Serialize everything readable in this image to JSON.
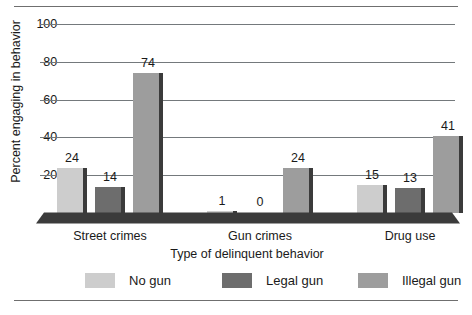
{
  "chart_data": {
    "type": "bar",
    "title": "",
    "xlabel": "Type of delinquent behavior",
    "ylabel": "Percent engaging in behavior",
    "categories": [
      "Street crimes",
      "Gun crimes",
      "Drug use"
    ],
    "series": [
      {
        "name": "No gun",
        "color": "#cdcdcd",
        "values": [
          24,
          1,
          15
        ]
      },
      {
        "name": "Legal gun",
        "color": "#6d6d6d",
        "values": [
          14,
          0,
          13
        ]
      },
      {
        "name": "Illegal gun",
        "color": "#9d9d9d",
        "values": [
          74,
          24,
          41
        ]
      }
    ],
    "ylim": [
      0,
      100
    ],
    "yticks": [
      20,
      40,
      60,
      80,
      100
    ],
    "ytick_labels": [
      "20",
      "40",
      "60",
      "80",
      "100"
    ],
    "grid": true,
    "legend_position": "bottom",
    "bar_value_labels": [
      [
        "24",
        "14",
        "74"
      ],
      [
        "1",
        "0",
        "24"
      ],
      [
        "15",
        "13",
        "41"
      ]
    ]
  },
  "axis": {
    "y_title": "Percent engaging in behavior",
    "x_title": "Type of delinquent behavior"
  },
  "legend": {
    "items": [
      {
        "label": "No gun"
      },
      {
        "label": "Legal gun"
      },
      {
        "label": "Illegal gun"
      }
    ]
  },
  "colors": {
    "no_gun": "#cdcdcd",
    "legal_gun": "#6d6d6d",
    "illegal_gun": "#9d9d9d",
    "bar_side": "#3b3b3b",
    "floor": "#3b3b3b",
    "gridline": "#74797c",
    "text": "#1a1a1a"
  }
}
